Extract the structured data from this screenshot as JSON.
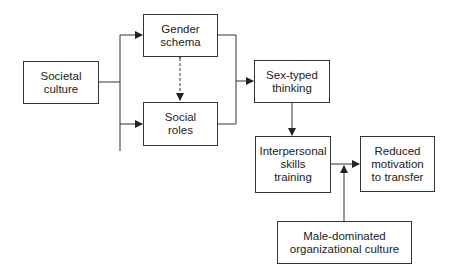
{
  "diagram": {
    "type": "flowchart",
    "nodes": [
      {
        "id": "societal_culture",
        "label": "Societal\nculture"
      },
      {
        "id": "gender_schema",
        "label": "Gender\nschema"
      },
      {
        "id": "social_roles",
        "label": "Social\nroles"
      },
      {
        "id": "sex_typed_thinking",
        "label": "Sex-typed\nthinking"
      },
      {
        "id": "interpersonal_training",
        "label": "Interpersonal\nskills\ntraining"
      },
      {
        "id": "reduced_motivation",
        "label": "Reduced\nmotivation\nto transfer"
      },
      {
        "id": "male_dominated_culture",
        "label": "Male-dominated\norganizational culture"
      }
    ],
    "edges": [
      {
        "from": "societal_culture",
        "to": "gender_schema",
        "style": "solid"
      },
      {
        "from": "societal_culture",
        "to": "social_roles",
        "style": "solid"
      },
      {
        "from": "gender_schema",
        "to": "social_roles",
        "style": "dashed",
        "bidirectional": true
      },
      {
        "from": "gender_schema",
        "to": "sex_typed_thinking",
        "style": "solid"
      },
      {
        "from": "social_roles",
        "to": "sex_typed_thinking",
        "style": "solid"
      },
      {
        "from": "sex_typed_thinking",
        "to": "interpersonal_training",
        "style": "solid"
      },
      {
        "from": "interpersonal_training",
        "to": "reduced_motivation",
        "style": "solid"
      },
      {
        "from": "male_dominated_culture",
        "to": "interpersonal_training->reduced_motivation",
        "style": "solid",
        "moderator": true
      }
    ]
  },
  "colors": {
    "line": "#333333",
    "background": "#ffffff"
  }
}
